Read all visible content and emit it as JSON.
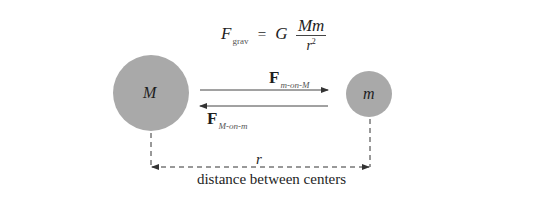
{
  "formula": {
    "lhs_symbol": "F",
    "lhs_subscript": "grav",
    "equals": "=",
    "constant": "G",
    "numerator": "Mm",
    "denominator_base": "r",
    "denominator_exponent": "2"
  },
  "bodies": [
    {
      "label": "M",
      "role": "large-mass",
      "cx": 151,
      "cy": 93,
      "radius": 38,
      "fill": "#a9a9a9"
    },
    {
      "label": "m",
      "role": "small-mass",
      "cx": 369,
      "cy": 94,
      "radius": 23,
      "fill": "#a9a9a9"
    }
  ],
  "forces": [
    {
      "symbol": "F",
      "subscript": "m-on-M",
      "direction": "right",
      "x1": 200,
      "x2": 328,
      "y": 90
    },
    {
      "symbol": "F",
      "subscript": "M-on-m",
      "direction": "left",
      "x1": 328,
      "x2": 200,
      "y": 106
    }
  ],
  "distance": {
    "symbol": "r",
    "caption": "distance between centers",
    "left_x": 151,
    "right_x": 370,
    "y": 167
  },
  "colors": {
    "body_fill": "#a9a9a9",
    "line": "#333333",
    "text": "#1e1e1e",
    "background": "#ffffff"
  }
}
